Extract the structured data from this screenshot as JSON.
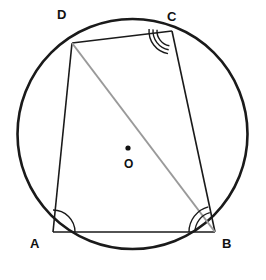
{
  "figure": {
    "background_color": "#ffffff",
    "width": 266,
    "height": 280
  },
  "circle": {
    "name": "circumcircle",
    "cx": 132.5,
    "cy": 134,
    "r": 115,
    "stroke": "#1a1a1a",
    "stroke_width": 2.6,
    "fill": "none"
  },
  "centre": {
    "label": "O",
    "dot_x": 128,
    "dot_y": 148,
    "dot_r": 2.6,
    "label_x": 124,
    "label_y": 158,
    "color": "#111111"
  },
  "vertices": [
    {
      "id": "A",
      "label": "A",
      "x": 53,
      "y": 232,
      "label_x": 30,
      "label_y": 237
    },
    {
      "id": "B",
      "label": "B",
      "x": 215,
      "y": 232,
      "label_x": 222,
      "label_y": 237
    },
    {
      "id": "C",
      "label": "C",
      "x": 172,
      "y": 31,
      "label_x": 167,
      "label_y": 10
    },
    {
      "id": "D",
      "label": "D",
      "x": 72,
      "y": 43,
      "label_x": 57,
      "label_y": 8
    }
  ],
  "edges": [
    {
      "name": "side-AB",
      "from": "A",
      "to": "B",
      "stroke": "#1a1a1a",
      "stroke_width": 1.6
    },
    {
      "name": "side-BC",
      "from": "B",
      "to": "C",
      "stroke": "#1a1a1a",
      "stroke_width": 1.6
    },
    {
      "name": "side-CD",
      "from": "C",
      "to": "D",
      "stroke": "#1a1a1a",
      "stroke_width": 1.6
    },
    {
      "name": "side-DA",
      "from": "D",
      "to": "A",
      "stroke": "#1a1a1a",
      "stroke_width": 1.6
    }
  ],
  "diagonal": {
    "name": "diagonal-DB",
    "from": "D",
    "to": "B",
    "stroke": "#9a9a9a",
    "stroke_width": 2.0
  },
  "angle_marks": [
    {
      "name": "angle-mark-A",
      "vertex": "A",
      "arc_count": 1,
      "radii": [
        22
      ],
      "start_deg": -90,
      "end_deg": 0,
      "stroke": "#1a1a1a",
      "stroke_width": 1.4
    },
    {
      "name": "angle-mark-B",
      "vertex": "B",
      "arc_count": 2,
      "radii": [
        20,
        26
      ],
      "start_deg": 180,
      "end_deg": 255,
      "stroke": "#1a1a1a",
      "stroke_width": 1.4
    },
    {
      "name": "angle-mark-C",
      "vertex": "C",
      "arc_count": 3,
      "radii": [
        15,
        19,
        23
      ],
      "start_deg": 100,
      "end_deg": 185,
      "stroke": "#1a1a1a",
      "stroke_width": 1.4
    }
  ]
}
